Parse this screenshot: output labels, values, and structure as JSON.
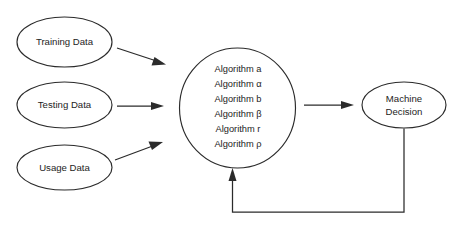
{
  "diagram": {
    "background_color": "#ffffff",
    "stroke_color": "#2b2b2b",
    "text_color": "#1d1d1d",
    "inputs": [
      {
        "label": "Training Data"
      },
      {
        "label": "Testing Data"
      },
      {
        "label": "Usage Data"
      }
    ],
    "processor": {
      "items": [
        "Algorithm a",
        "Algorithm α",
        "Algorithm b",
        "Algorithm β",
        "Algorithm r",
        "Algorithm ρ"
      ]
    },
    "output": {
      "line1": "Machine",
      "line2": "Decision"
    },
    "edges": [
      {
        "name": "training-to-algorithms",
        "style": "diagonal-down-arrow"
      },
      {
        "name": "testing-to-algorithms",
        "style": "horizontal-arrow"
      },
      {
        "name": "usage-to-algorithms",
        "style": "diagonal-up-arrow"
      },
      {
        "name": "algorithms-to-decision",
        "style": "horizontal-arrow"
      },
      {
        "name": "decision-feedback-to-algorithms",
        "style": "elbow-feedback-arrow"
      }
    ]
  }
}
